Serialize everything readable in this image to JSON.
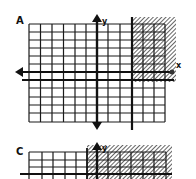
{
  "panels": [
    {
      "id": "A",
      "label": "A",
      "axis_x_label": "x",
      "axis_y_label": "y",
      "inequality_description": "Shaded region to the right of a vertical boundary line and above a horizontal line below the x-axis",
      "shading": "diagonal hatch"
    },
    {
      "id": "C",
      "label": "C",
      "axis_y_label": "y",
      "inequality_description": "Shaded region to the right of a vertical boundary just left of the y-axis",
      "shading": "diagonal hatch"
    }
  ],
  "colors": {
    "ink": "#111111",
    "background": "#ffffff"
  }
}
